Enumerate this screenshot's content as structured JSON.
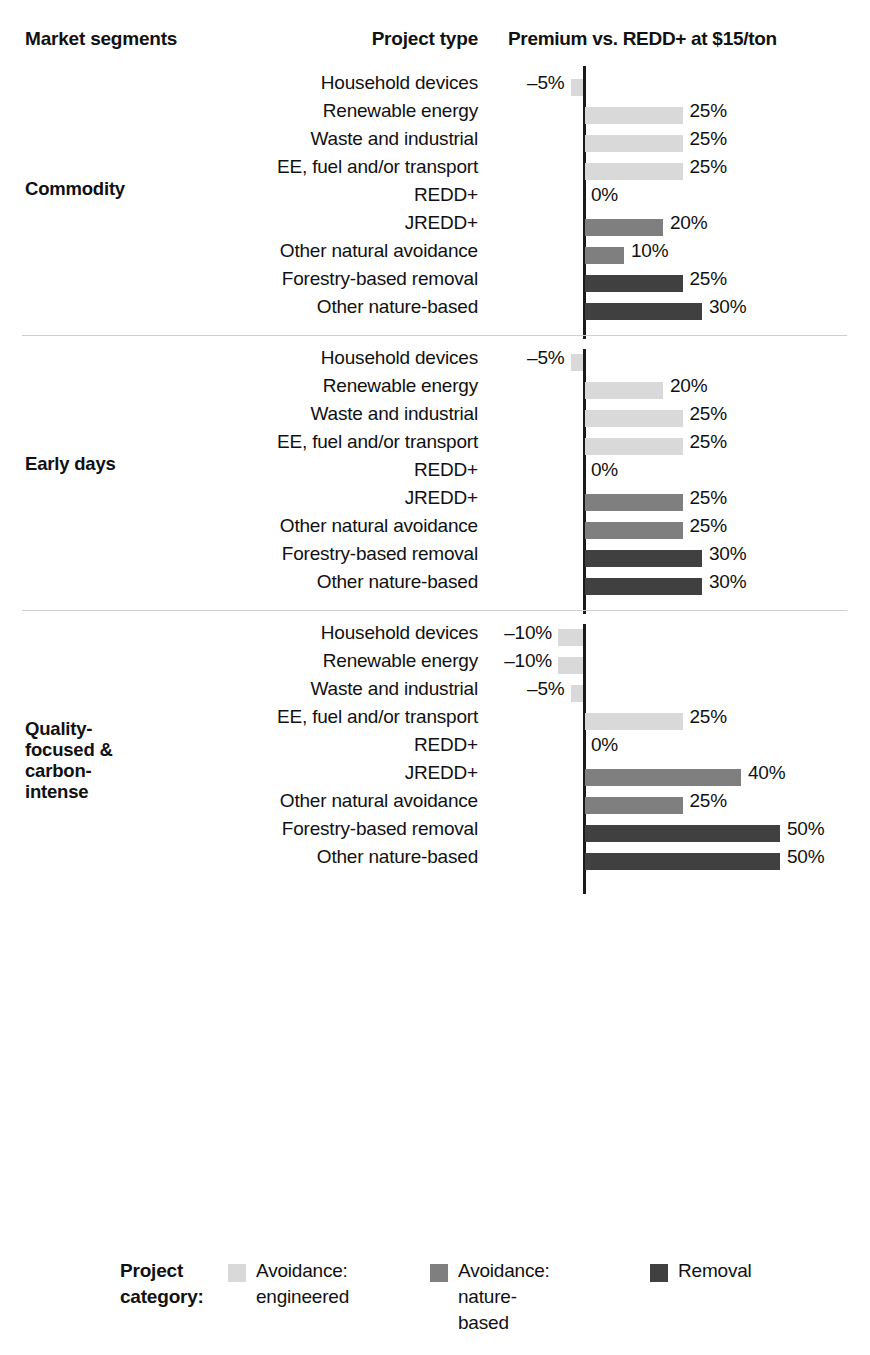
{
  "header": {
    "market_segments": "Market segments",
    "project_type": "Project type",
    "premium": "Premium vs. REDD+ at $15/ton"
  },
  "axis": {
    "zero_label": "0%"
  },
  "legend": {
    "title": "Project\ncategory:",
    "items": [
      {
        "label": "Avoidance:\nengineered",
        "color": "#d9d9d9"
      },
      {
        "label": "Avoidance:\nnature-based",
        "color": "#7f7f7f"
      },
      {
        "label": "Removal",
        "color": "#404040"
      }
    ]
  },
  "chart_data": {
    "type": "bar",
    "title": "Premium vs. REDD+ at $15/ton",
    "xlabel": "Premium vs. REDD+ at $15/ton",
    "ylabel": "Project type",
    "grid": false,
    "legend_position": "bottom",
    "orientation": "horizontal",
    "note": "Percent premium versus REDD+ benchmark price of $15/ton; negative axis is compressed with break marks.",
    "categories": [
      "Household devices",
      "Renewable energy",
      "Waste and industrial",
      "EE, fuel and/or transport",
      "REDD+",
      "JREDD+",
      "Other natural avoidance",
      "Forestry-based removal",
      "Other nature-based"
    ],
    "series": [
      {
        "name": "Commodity",
        "segment_label": "Commodity",
        "values": [
          -5,
          25,
          25,
          25,
          0,
          20,
          10,
          25,
          30
        ],
        "labels": [
          "–5%",
          "25%",
          "25%",
          "25%",
          "0%",
          "20%",
          "10%",
          "25%",
          "30%"
        ],
        "categories_colors": [
          "engineered",
          "engineered",
          "engineered",
          "engineered",
          "none",
          "nature-based",
          "nature-based",
          "removal",
          "removal"
        ]
      },
      {
        "name": "Early days",
        "segment_label": "Early days",
        "values": [
          -5,
          20,
          25,
          25,
          0,
          25,
          25,
          30,
          30
        ],
        "labels": [
          "–5%",
          "20%",
          "25%",
          "25%",
          "0%",
          "25%",
          "25%",
          "30%",
          "30%"
        ],
        "categories_colors": [
          "engineered",
          "engineered",
          "engineered",
          "engineered",
          "none",
          "nature-based",
          "nature-based",
          "removal",
          "removal"
        ]
      },
      {
        "name": "Quality-focused & carbon-intense",
        "segment_label": "Quality-\nfocused &\ncarbon-\nintense",
        "values": [
          -10,
          -10,
          -5,
          25,
          0,
          40,
          25,
          50,
          50
        ],
        "labels": [
          "–10%",
          "–10%",
          "–5%",
          "25%",
          "0%",
          "40%",
          "25%",
          "50%",
          "50%"
        ],
        "categories_colors": [
          "engineered",
          "engineered",
          "engineered",
          "engineered",
          "none",
          "nature-based",
          "nature-based",
          "removal",
          "removal"
        ]
      },
      {
        "name": "Premium quality",
        "segment_label": "Premium\nquality",
        "values": [
          -30,
          null,
          -65,
          -5,
          0,
          40,
          25,
          50,
          50
        ],
        "labels": [
          "–30%",
          "N/A",
          "–65%",
          "–5%",
          "0%",
          "40%",
          "25%",
          "50%",
          "50%"
        ],
        "categories_colors": [
          "engineered",
          "none",
          "engineered",
          "engineered",
          "none",
          "nature-based",
          "nature-based",
          "removal",
          "removal"
        ],
        "axis_breaks": [
          1,
          0,
          2,
          0,
          0,
          0,
          0,
          0,
          0
        ]
      }
    ],
    "colors": {
      "engineered": "#d9d9d9",
      "nature-based": "#7f7f7f",
      "removal": "#404040"
    }
  }
}
